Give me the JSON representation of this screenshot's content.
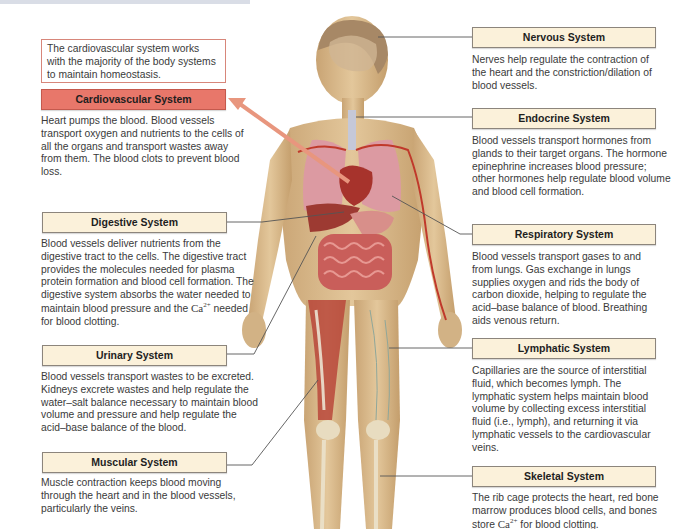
{
  "intro": {
    "text": "The cardiovascular system works with the majority of the body systems to maintain homeostasis."
  },
  "colors": {
    "primary_label_bg": "#e8776a",
    "secondary_label_bg": "#fbf1da",
    "intro_border": "#d7867a",
    "arrow": "#e8967e",
    "skin": "#d9b98a",
    "muscle": "#b8473a"
  },
  "systems": {
    "cardiovascular": {
      "title": "Cardiovascular System",
      "desc": "Heart pumps the blood. Blood vessels transport oxygen and nutrients to the cells of all the organs and transport wastes away from them. The blood clots to prevent blood loss."
    },
    "digestive": {
      "title": "Digestive System",
      "desc_before_ca": "Blood vessels deliver nutrients from the digestive tract to the cells. The digestive tract provides the molecules needed for plasma protein formation and blood cell formation. The digestive system absorbs the water needed to maintain blood pressure and the",
      "ca": "Ca",
      "ca_charge": "2+",
      "desc_after_ca": " needed for blood clotting."
    },
    "urinary": {
      "title": "Urinary System",
      "desc": "Blood vessels transport wastes to be excreted. Kidneys excrete wastes and help regulate the water–salt balance necessary to maintain blood volume and pressure and help regulate the acid–base balance of the blood."
    },
    "muscular": {
      "title": "Muscular System",
      "desc": "Muscle contraction keeps blood moving through the heart and in the blood vessels, particularly the veins."
    },
    "nervous": {
      "title": "Nervous System",
      "desc": "Nerves help regulate the contraction of the heart and the constriction/dilation of blood vessels."
    },
    "endocrine": {
      "title": "Endocrine System",
      "desc": "Blood vessels transport hormones from glands to their target organs. The hormone epinephrine increases blood pressure; other hormones help regulate blood volume and blood cell formation."
    },
    "respiratory": {
      "title": "Respiratory System",
      "desc": "Blood vessels transport gases to and from lungs. Gas exchange in lungs supplies oxygen and rids the body of carbon dioxide, helping to regulate the acid–base balance of blood. Breathing aids venous return."
    },
    "lymphatic": {
      "title": "Lymphatic System",
      "desc": "Capillaries are the source of interstitial fluid, which becomes lymph. The lymphatic system helps maintain blood volume by collecting excess interstitial fluid (i.e., lymph), and returning it via lymphatic vessels to the cardiovascular veins."
    },
    "skeletal": {
      "title": "Skeletal System",
      "desc_before_ca": "The rib cage protects the heart, red bone marrow produces blood cells, and bones store ",
      "ca": "Ca",
      "ca_charge": "2+",
      "desc_after_ca": " for blood clotting."
    }
  }
}
